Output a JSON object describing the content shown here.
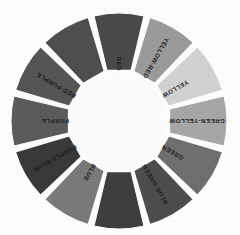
{
  "figure": {
    "kind": "color-wheel-diagram",
    "rendering": "greyscale-halftone",
    "background_color": "#ffffff",
    "hub_color": "#fdfdfd",
    "segment_gap_color": "#ffffff",
    "label_color": "#1c1c1c",
    "center_x": 119,
    "center_y": 121,
    "inner_radius": 48,
    "outer_radius": 108,
    "segment_count": 12
  },
  "chart_data": {
    "type": "pie",
    "title": "",
    "xlabel": "",
    "ylabel": "",
    "legend_position": "none",
    "grid": false,
    "categories": [
      "RED",
      "YELLOW-RED",
      "YELLOW",
      "GREEN-YELLOW",
      "GREEN",
      "BLUE-GREEN",
      "BLUE",
      "PURPLE-BLUE",
      "PURPLE",
      "RED-PURPLE"
    ],
    "values": [
      30,
      30,
      30,
      30,
      30,
      30,
      30,
      30,
      30,
      30
    ],
    "colors": [
      "#4a4a4a",
      "#9c9c9c",
      "#d3d3d3",
      "#a8a8a8",
      "#707070",
      "#4e4e4e",
      "#7b7b7b",
      "#3a3a3a",
      "#5c5c5c",
      "#565656"
    ]
  },
  "segments": [
    {
      "label": "RED",
      "ring_color": "#4a4a4a",
      "start_angle": -15,
      "end_angle": 15,
      "label_angle": 0
    },
    {
      "label": "YELLOW-RED",
      "ring_color": "#9c9c9c",
      "start_angle": 15,
      "end_angle": 45,
      "label_angle": 30
    },
    {
      "label": "YELLOW",
      "ring_color": "#d3d3d3",
      "start_angle": 45,
      "end_angle": 75,
      "label_angle": 60
    },
    {
      "label": "GREEN-YELLOW",
      "ring_color": "#a8a8a8",
      "start_angle": 75,
      "end_angle": 105,
      "label_angle": 90
    },
    {
      "label": "GREEN",
      "ring_color": "#707070",
      "start_angle": 105,
      "end_angle": 135,
      "label_angle": 120
    },
    {
      "label": "BLUE-GREEN",
      "ring_color": "#4e4e4e",
      "start_angle": 135,
      "end_angle": 165,
      "label_angle": 150
    },
    {
      "label": "",
      "ring_color": "#3f3f3f",
      "start_angle": 165,
      "end_angle": 195,
      "label_angle": 180
    },
    {
      "label": "BLUE",
      "ring_color": "#7b7b7b",
      "start_angle": 195,
      "end_angle": 225,
      "label_angle": 210
    },
    {
      "label": "PURPLE-BLUE",
      "ring_color": "#3a3a3a",
      "start_angle": 225,
      "end_angle": 255,
      "label_angle": 240
    },
    {
      "label": "PURPLE",
      "ring_color": "#5c5c5c",
      "start_angle": 255,
      "end_angle": 285,
      "label_angle": 270
    },
    {
      "label": "RED-PURPLE",
      "ring_color": "#565656",
      "start_angle": 285,
      "end_angle": 315,
      "label_angle": 300
    },
    {
      "label": "",
      "ring_color": "#4f4f4f",
      "start_angle": 315,
      "end_angle": 345,
      "label_angle": 330
    }
  ]
}
